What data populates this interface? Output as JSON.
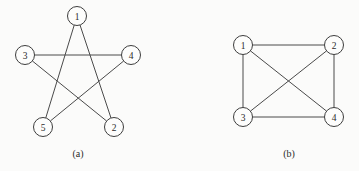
{
  "figure": {
    "background_color": "#fbfbfa",
    "edge_color": "#4a4a4a",
    "node_fill_color": "#fdfdfc",
    "node_stroke_color": "#3d3d3d",
    "text_color": "#2b2b2b",
    "node_radius": 9.5
  },
  "chart_data": {
    "type": "diagram",
    "title": "",
    "subtitle": "",
    "xlabel": "",
    "ylabel": "",
    "grid": false,
    "legend_position": "none",
    "panels": [
      {
        "id": "panel-a",
        "caption": "(a)",
        "caption_x": 78,
        "caption_y": 153,
        "description": "pentagram",
        "node_count": 5,
        "edge_count": 5,
        "nodes": [
          {
            "label": "1",
            "x": 77,
            "y": 16
          },
          {
            "label": "4",
            "x": 131,
            "y": 55
          },
          {
            "label": "2",
            "x": 114,
            "y": 127
          },
          {
            "label": "5",
            "x": 43,
            "y": 127
          },
          {
            "label": "3",
            "x": 25,
            "y": 55
          }
        ],
        "edges": [
          {
            "from": "1",
            "to": "2"
          },
          {
            "from": "2",
            "to": "3"
          },
          {
            "from": "3",
            "to": "4"
          },
          {
            "from": "4",
            "to": "5"
          },
          {
            "from": "5",
            "to": "1"
          }
        ]
      },
      {
        "id": "panel-b",
        "caption": "(b)",
        "caption_x": 289,
        "caption_y": 153,
        "description": "complete-graph-k4",
        "node_count": 4,
        "edge_count": 6,
        "nodes": [
          {
            "label": "1",
            "x": 243,
            "y": 45
          },
          {
            "label": "2",
            "x": 334,
            "y": 45
          },
          {
            "label": "3",
            "x": 243,
            "y": 117
          },
          {
            "label": "4",
            "x": 334,
            "y": 117
          }
        ],
        "edges": [
          {
            "from": "1",
            "to": "2"
          },
          {
            "from": "1",
            "to": "3"
          },
          {
            "from": "1",
            "to": "4"
          },
          {
            "from": "2",
            "to": "3"
          },
          {
            "from": "2",
            "to": "4"
          },
          {
            "from": "3",
            "to": "4"
          }
        ]
      }
    ]
  }
}
